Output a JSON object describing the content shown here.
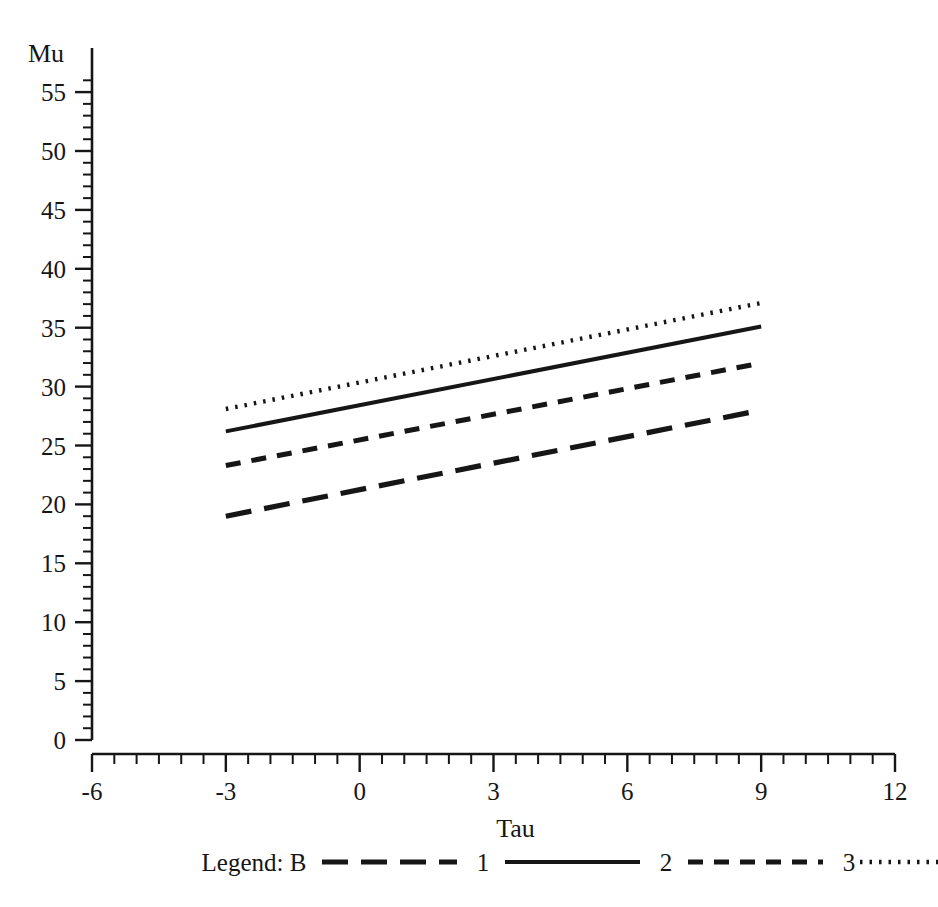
{
  "chart_data": {
    "type": "line",
    "title": "",
    "xlabel": "Tau",
    "ylabel": "Mu",
    "xlim": [
      -6,
      12
    ],
    "ylim": [
      0,
      57
    ],
    "x_major_ticks": [
      -6,
      -3,
      0,
      3,
      6,
      9,
      12
    ],
    "x_tick_labels": [
      "-6",
      "-3",
      "0",
      "3",
      "6",
      "9",
      "12"
    ],
    "x_minor_step": 0.5,
    "y_major_ticks": [
      0,
      5,
      10,
      15,
      20,
      25,
      30,
      35,
      40,
      45,
      50,
      55
    ],
    "y_tick_labels": [
      "0",
      "5",
      "10",
      "15",
      "20",
      "25",
      "30",
      "35",
      "40",
      "45",
      "50",
      "55"
    ],
    "y_minor_step": 1,
    "grid": false,
    "legend_position": "bottom",
    "x": [
      -3,
      9
    ],
    "series": [
      {
        "name": "1",
        "values": [
          19.0,
          28.0
        ],
        "style": "long-dash"
      },
      {
        "name": "2",
        "values": [
          26.2,
          35.1
        ],
        "style": "solid"
      },
      {
        "name": "3",
        "values": [
          23.3,
          32.0
        ],
        "style": "short-dash"
      },
      {
        "name": "4",
        "values": [
          28.1,
          37.1
        ],
        "style": "dotted"
      }
    ]
  },
  "legend": {
    "title": "Legend:  B",
    "entries": [
      {
        "label": "1",
        "style": "long-dash"
      },
      {
        "label": "2",
        "style": "solid"
      },
      {
        "label": "3",
        "style": "short-dash"
      },
      {
        "label": "4",
        "style": "dotted"
      }
    ]
  },
  "colors": {
    "ink": "#161616",
    "background": "#ffffff"
  }
}
